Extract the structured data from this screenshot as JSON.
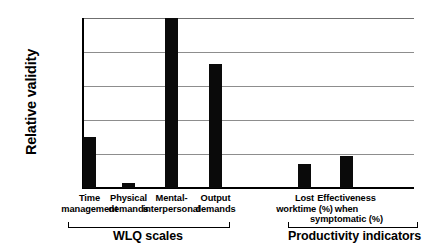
{
  "chart_data": {
    "type": "bar",
    "title": "",
    "xlabel": "",
    "ylabel": "Relative validity",
    "ylim": [
      0,
      1
    ],
    "yticks": [
      "0",
      "0.2",
      "0.4",
      "0.6",
      "0.8",
      "1"
    ],
    "ytick_values": [
      0,
      0.2,
      0.4,
      0.6,
      0.8,
      1
    ],
    "grid": true,
    "legend": "none",
    "bar_color": "#0a0a0a",
    "categories": [
      "Time management",
      "Physical demands",
      "Mental-interpersonal",
      "Output demands",
      "Lost worktime (%)",
      "Effectiveness when symptomatic (%)"
    ],
    "values": [
      0.3,
      0.03,
      1.0,
      0.73,
      0.14,
      0.19
    ],
    "category_label_lines": [
      [
        "Time",
        "management"
      ],
      [
        "Physical",
        "demands"
      ],
      [
        "Mental-",
        "interpersonal"
      ],
      [
        "Output",
        "demands"
      ],
      [
        "Lost",
        "worktime (%)"
      ],
      [
        "Effectiveness",
        "when",
        "symptomatic (%)"
      ]
    ],
    "groups": [
      {
        "label": "WLQ scales",
        "category_indices": [
          0,
          1,
          2,
          3
        ]
      },
      {
        "label": "Productivity indicators",
        "category_indices": [
          4,
          5
        ]
      }
    ]
  }
}
